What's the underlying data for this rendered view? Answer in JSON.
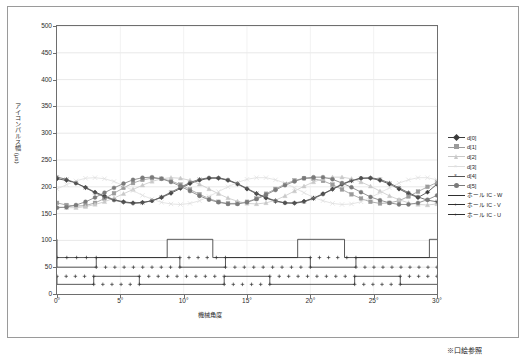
{
  "footnote": "※口絵参照",
  "chart_data": {
    "type": "line",
    "title": "",
    "xlabel": "機械角度",
    "ylabel": "アイコンパルス幅 (μs)",
    "xlim": [
      0,
      30
    ],
    "ylim": [
      0,
      500
    ],
    "ytick_labels": [
      "0",
      "50",
      "100",
      "150",
      "200",
      "250",
      "300",
      "350",
      "400",
      "450",
      "500"
    ],
    "ytick_values": [
      0,
      50,
      100,
      150,
      200,
      250,
      300,
      350,
      400,
      450,
      500
    ],
    "xtick_labels": [
      "0°",
      "5°",
      "10°",
      "15°",
      "20°",
      "25°",
      "30°"
    ],
    "xtick_values": [
      0,
      5,
      10,
      15,
      20,
      25,
      30
    ],
    "grid": true,
    "legend_position": "right",
    "series": [
      {
        "name": "d[0]",
        "color": "#3b3b3b",
        "marker": "diamond",
        "x": [
          0,
          0.75,
          1.5,
          2.25,
          3,
          3.75,
          4.5,
          5.25,
          6,
          6.75,
          7.5,
          8.25,
          9,
          9.75,
          10.5,
          11.25,
          12,
          12.75,
          13.5,
          14.25,
          15,
          15.75,
          16.5,
          17.25,
          18,
          18.75,
          19.5,
          20.25,
          21,
          21.75,
          22.5,
          23.25,
          24,
          24.75,
          25.5,
          26.25,
          27,
          27.75,
          28.5,
          29.25,
          30
        ],
        "values": [
          215,
          212,
          207,
          199,
          190,
          183,
          176,
          172,
          170,
          171,
          174,
          180,
          188,
          197,
          206,
          212,
          216,
          216,
          212,
          205,
          196,
          187,
          179,
          173,
          170,
          170,
          173,
          179,
          187,
          196,
          205,
          212,
          216,
          216,
          212,
          205,
          196,
          187,
          180,
          190,
          205
        ]
      },
      {
        "name": "d[1]",
        "color": "#9b9b9b",
        "marker": "square",
        "x": [
          0,
          0.75,
          1.5,
          2.25,
          3,
          3.75,
          4.5,
          5.25,
          6,
          6.75,
          7.5,
          8.25,
          9,
          9.75,
          10.5,
          11.25,
          12,
          12.75,
          13.5,
          14.25,
          15,
          15.75,
          16.5,
          17.25,
          18,
          18.75,
          19.5,
          20.25,
          21,
          21.75,
          22.5,
          23.25,
          24,
          24.75,
          25.5,
          26.25,
          27,
          27.75,
          28.5,
          29.25,
          30
        ],
        "values": [
          170,
          166,
          164,
          165,
          170,
          178,
          188,
          198,
          207,
          213,
          216,
          215,
          211,
          204,
          195,
          186,
          178,
          172,
          169,
          169,
          172,
          178,
          187,
          196,
          205,
          212,
          216,
          215,
          211,
          204,
          195,
          186,
          178,
          172,
          169,
          170,
          174,
          182,
          191,
          200,
          208
        ]
      },
      {
        "name": "d[2]",
        "color": "#c9c9c9",
        "marker": "triangle",
        "x": [
          0,
          0.75,
          1.5,
          2.25,
          3,
          3.75,
          4.5,
          5.25,
          6,
          6.75,
          7.5,
          8.25,
          9,
          9.75,
          10.5,
          11.25,
          12,
          12.75,
          13.5,
          14.25,
          15,
          15.75,
          16.5,
          17.25,
          18,
          18.75,
          19.5,
          20.25,
          21,
          21.75,
          22.5,
          23.25,
          24,
          24.75,
          25.5,
          26.25,
          27,
          27.75,
          28.5,
          29.25,
          30
        ],
        "values": [
          163,
          161,
          161,
          163,
          167,
          172,
          179,
          187,
          195,
          203,
          210,
          215,
          217,
          216,
          212,
          205,
          196,
          187,
          179,
          173,
          169,
          168,
          170,
          175,
          183,
          192,
          201,
          209,
          215,
          218,
          218,
          215,
          209,
          201,
          192,
          183,
          176,
          170,
          167,
          166,
          168
        ]
      },
      {
        "name": "d[3]",
        "color": "#dedede",
        "marker": "cross",
        "x": [
          0,
          0.75,
          1.5,
          2.25,
          3,
          3.75,
          4.5,
          5.25,
          6,
          6.75,
          7.5,
          8.25,
          9,
          9.75,
          10.5,
          11.25,
          12,
          12.75,
          13.5,
          14.25,
          15,
          15.75,
          16.5,
          17.25,
          18,
          18.75,
          19.5,
          20.25,
          21,
          21.75,
          22.5,
          23.25,
          24,
          24.75,
          25.5,
          26.25,
          27,
          27.75,
          28.5,
          29.25,
          30
        ],
        "values": [
          196,
          204,
          211,
          216,
          217,
          215,
          210,
          202,
          193,
          184,
          177,
          171,
          168,
          167,
          169,
          174,
          182,
          191,
          200,
          208,
          214,
          217,
          217,
          213,
          207,
          198,
          189,
          180,
          174,
          169,
          167,
          168,
          172,
          180,
          189,
          198,
          207,
          213,
          217,
          217,
          213
        ]
      },
      {
        "name": "d[4]",
        "color": "#555555",
        "marker": "star",
        "x": [
          0,
          0.75,
          1.5,
          2.25,
          3,
          3.75,
          4.5,
          5.25,
          6,
          6.75,
          7.5,
          8.25,
          9,
          9.75,
          10.5,
          11.25,
          12,
          12.75,
          13.5,
          14.25,
          15,
          15.75,
          16.5,
          17.25,
          18,
          18.75,
          19.5,
          20.25,
          21,
          21.75,
          22.5,
          23.25,
          24,
          24.75,
          25.5,
          26.25,
          27,
          27.75,
          28.5,
          29.25,
          30
        ],
        "values": [
          218,
          214,
          207,
          198,
          189,
          181,
          175,
          171,
          169,
          170,
          174,
          181,
          190,
          199,
          208,
          214,
          217,
          217,
          213,
          206,
          197,
          188,
          180,
          174,
          170,
          169,
          172,
          178,
          186,
          195,
          204,
          211,
          216,
          217,
          214,
          207,
          198,
          189,
          181,
          175,
          172
        ]
      },
      {
        "name": "d[5]",
        "color": "#7a7a7a",
        "marker": "circle",
        "x": [
          0,
          0.75,
          1.5,
          2.25,
          3,
          3.75,
          4.5,
          5.25,
          6,
          6.75,
          7.5,
          8.25,
          9,
          9.75,
          10.5,
          11.25,
          12,
          12.75,
          13.5,
          14.25,
          15,
          15.75,
          16.5,
          17.25,
          18,
          18.75,
          19.5,
          20.25,
          21,
          21.75,
          22.5,
          23.25,
          24,
          24.75,
          25.5,
          26.25,
          27,
          27.75,
          28.5,
          29.25,
          30
        ],
        "values": [
          161,
          162,
          166,
          172,
          180,
          189,
          198,
          206,
          213,
          217,
          218,
          215,
          209,
          201,
          192,
          183,
          176,
          171,
          168,
          168,
          171,
          177,
          185,
          194,
          203,
          210,
          216,
          218,
          218,
          214,
          207,
          199,
          190,
          181,
          175,
          170,
          167,
          167,
          170,
          176,
          184
        ]
      },
      {
        "name": "ホール IC - W",
        "color": "#2f2f2f",
        "marker": "none",
        "type": "square-wave",
        "high": 102,
        "low": 68,
        "transitions": [
          0,
          8.7,
          12.3,
          19.0,
          22.7,
          29.4,
          30
        ]
      },
      {
        "name": "ホール IC - V",
        "color": "#2f2f2f",
        "marker": "plus",
        "type": "square-wave",
        "high": 68,
        "low": 50,
        "transitions": [
          0,
          3.1,
          9.7,
          13.3,
          20.0,
          23.6,
          30
        ]
      },
      {
        "name": "ホール IC - U",
        "color": "#2f2f2f",
        "marker": "plus",
        "type": "square-wave",
        "high": 33,
        "low": 18,
        "transitions": [
          0,
          2.9,
          6.5,
          13.2,
          16.8,
          23.5,
          27.1,
          30
        ]
      }
    ]
  }
}
